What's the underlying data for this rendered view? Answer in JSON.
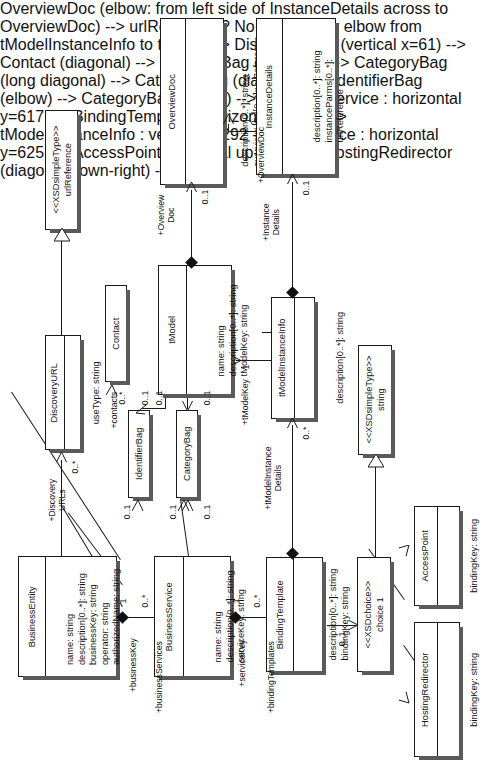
{
  "diagram": {
    "orientation": "rotated-90",
    "stereotypes": {
      "xsd_simple_type": "<<XSDsimpleType>>",
      "xsd_choice": "<<XSDchoice>>"
    },
    "classes": [
      {
        "id": "urlReference",
        "stereotype": "<<XSDsimpleType>>",
        "name": "urlReference",
        "attributes": []
      },
      {
        "id": "overviewDoc",
        "name": "OverviewDoc",
        "attributes": [
          "description[0..*]: string",
          "overviewURL[0..*]:urlReference"
        ]
      },
      {
        "id": "instanceDetails",
        "name": "InstanceDetails",
        "attributes": [
          "description[0..*]: string",
          "instanceParms[0..*]:",
          "urlReference"
        ]
      },
      {
        "id": "discoveryURL",
        "name": "DiscoveryURL",
        "attributes": [
          "useType: string"
        ]
      },
      {
        "id": "contact",
        "name": "Contact",
        "attributes": []
      },
      {
        "id": "identifierBag",
        "name": "IdentifierBag",
        "attributes": []
      },
      {
        "id": "categoryBag",
        "name": "CategoryBag",
        "attributes": []
      },
      {
        "id": "tModel",
        "name": "tModel",
        "attributes": [
          "name: string",
          "description[0..*]: string",
          "tModelKey: string"
        ]
      },
      {
        "id": "tModelInstanceInfo",
        "name": "tModelInstanceInfo",
        "attributes": [
          "description[0..*]: string"
        ]
      },
      {
        "id": "businessEntity",
        "name": "BusinessEntity",
        "attributes": [
          "name:  string",
          "description[0..*]: string",
          "businessKey: string",
          "operator: string",
          "authorizedName: string"
        ]
      },
      {
        "id": "businessService",
        "name": "BusinessService",
        "attributes": [
          "name: string",
          "description[0..*]: string",
          "serviceKey: string"
        ]
      },
      {
        "id": "bindingTemplate",
        "name": "BindingTemplate",
        "attributes": [
          "description[0..*]: string",
          "bindingKey: string"
        ]
      },
      {
        "id": "stringSimpleType",
        "stereotype": "<<XSDsimpleType>>",
        "name": "string",
        "attributes": []
      },
      {
        "id": "xsdChoice",
        "stereotype": "<<XSDchoice>>",
        "name": "choice 1",
        "attributes": []
      },
      {
        "id": "accessPoint",
        "name": "AccessPoint",
        "attributes": [
          "bindingKey: string"
        ]
      },
      {
        "id": "hostingRedirector",
        "name": "HostingRedirector",
        "attributes": [
          "bindingKey: string"
        ]
      }
    ],
    "association_labels": {
      "overview_doc_tmodel": "+Overview\nDoc",
      "overview_doc_instance": "+OverviewDoc",
      "instance_details": "+Instance\nDetails",
      "discovery_urls": "+Discovery\nURLs",
      "contacts": "+contacts",
      "tmodel_key": "+tModelKey",
      "tmodel_instance_details": "+tModelInstance\nDetails",
      "business_key": "+businessKey",
      "business_services": "+businessServices",
      "service_key": "+serviceKey",
      "binding_templates": "+bindingTemplates"
    },
    "multiplicities": {
      "overview_doc_tmodel": "0..1",
      "overview_doc_instance": "0..1",
      "instance_details": "0..1",
      "instance_details_src": "0..1",
      "discovery_urls": "0..*",
      "contacts": "0..*",
      "contacts_src": "0..1",
      "identifier_bag_be": "0..1",
      "identifier_bag_tm": "0..1",
      "category_bag_be": "0..1",
      "category_bag_bs": "0..1",
      "category_bag_tm": "0..1",
      "tmodel_key": "1",
      "tmodel_instance_details": "0..*",
      "business_key": "1",
      "business_services": "0..*",
      "service_key": "1",
      "binding_templates": "0..*",
      "choice": "0..1"
    }
  }
}
